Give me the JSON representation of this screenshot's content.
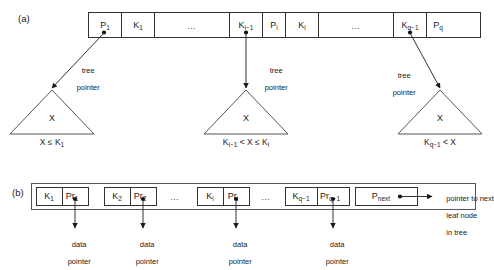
{
  "figure": {
    "panels": [
      {
        "id": "a",
        "label": "(a)",
        "caption_label": "(a)"
      },
      {
        "id": "b",
        "label": "(b)",
        "caption_label": "(b)"
      }
    ]
  },
  "internal_node": {
    "cells": [
      {
        "key": "c1",
        "text": "P",
        "sub": "1",
        "type": "pointer",
        "has_dot": true
      },
      {
        "key": "c2",
        "text": "K",
        "sub": "1",
        "type": "key",
        "has_dot": false
      },
      {
        "key": "c3",
        "text": "…",
        "sub": "",
        "type": "ellipsis",
        "has_dot": false
      },
      {
        "key": "c4",
        "text": "K",
        "sub": "i−1",
        "type": "key",
        "has_dot": false
      },
      {
        "key": "c5",
        "text": "P",
        "sub": "i",
        "type": "pointer",
        "has_dot": true
      },
      {
        "key": "c6",
        "text": "K",
        "sub": "i",
        "type": "key",
        "has_dot": false
      },
      {
        "key": "c7",
        "text": "…",
        "sub": "",
        "type": "ellipsis",
        "has_dot": false
      },
      {
        "key": "c8",
        "text": "K",
        "sub": "q−1",
        "type": "key",
        "has_dot": false
      },
      {
        "key": "c9",
        "text": "P",
        "sub": "q",
        "type": "pointer",
        "has_dot": true
      },
      {
        "key": "c10",
        "text": "",
        "sub": "",
        "type": "empty",
        "has_dot": false
      }
    ],
    "pointer_annotations": [
      {
        "key": "p1",
        "line1": "tree",
        "line2": "pointer"
      },
      {
        "key": "p2",
        "line1": "tree",
        "line2": "pointer"
      },
      {
        "key": "p3",
        "line1": "tree",
        "line2": "pointer"
      }
    ],
    "subtrees": [
      {
        "key": "t1",
        "label": "X",
        "condition_html": "X ≤ K<sub>1</sub>"
      },
      {
        "key": "t2",
        "label": "X",
        "condition_html": "K<sub>i−1</sub> &lt; X ≤ K<sub>i</sub>"
      },
      {
        "key": "t3",
        "label": "X",
        "condition_html": "K<sub>q−1</sub> &lt; X"
      }
    ]
  },
  "leaf_node": {
    "pairs": [
      {
        "key": "pr1",
        "key_text": "K",
        "key_sub": "1",
        "ptr_text": "Pr",
        "ptr_sub": "1"
      },
      {
        "key": "pr2",
        "key_text": "K",
        "key_sub": "2",
        "ptr_text": "Pr",
        "ptr_sub": "2"
      },
      {
        "key": "pr3",
        "key_text": "K",
        "key_sub": "i",
        "ptr_text": "Pr",
        "ptr_sub": "i"
      },
      {
        "key": "pr4",
        "key_text": "K",
        "key_sub": "q−1",
        "ptr_text": "Pr",
        "ptr_sub": "q−1"
      }
    ],
    "ellipses": [
      {
        "key": "e1",
        "text": "…"
      },
      {
        "key": "e2",
        "text": "…"
      }
    ],
    "next_pointer_cell": {
      "text": "P",
      "sub": "next"
    },
    "data_pointer_labels": [
      {
        "key": "d1",
        "line1": "data",
        "line2": "pointer"
      },
      {
        "key": "d2",
        "line1": "data",
        "line2": "pointer"
      },
      {
        "key": "d3",
        "line1": "data",
        "line2": "pointer"
      },
      {
        "key": "d4",
        "line1": "data",
        "line2": "pointer"
      }
    ],
    "next_annotation": {
      "line1": "pointer to next",
      "line2": "leaf node",
      "line3": "in tree"
    }
  },
  "colors": {
    "stroke": "#333333",
    "text": "#1a1a1a",
    "background": "#ffffff",
    "ellipsis": "#4a4a4a"
  }
}
